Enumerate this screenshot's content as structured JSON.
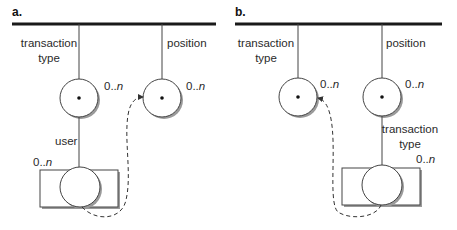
{
  "colors": {
    "line": "#1a1a1a",
    "stroke": "#444444",
    "shadow": "#9a9a9a",
    "text": "#2a2a2a"
  },
  "panels": [
    {
      "label": "a.",
      "nodes": [
        {
          "name": "transaction-type",
          "label_line1": "transaction",
          "label_line2": "type",
          "cardinality_prefix": "0..",
          "cardinality_suffix": "n"
        },
        {
          "name": "position",
          "label_line1": "position",
          "cardinality_prefix": "0..",
          "cardinality_suffix": "n"
        },
        {
          "name": "user",
          "label_line1": "user",
          "cardinality_prefix": "0..",
          "cardinality_suffix": "n"
        }
      ],
      "arrow": {
        "from": "user",
        "to": "position",
        "style": "dashed"
      }
    },
    {
      "label": "b.",
      "nodes": [
        {
          "name": "transaction-type",
          "label_line1": "transaction",
          "label_line2": "type",
          "cardinality_prefix": "0..",
          "cardinality_suffix": "n"
        },
        {
          "name": "position",
          "label_line1": "position",
          "cardinality_prefix": "0..",
          "cardinality_suffix": "n"
        },
        {
          "name": "transaction-type-nested",
          "label_line1": "transaction",
          "label_line2": "type",
          "cardinality_prefix": "0..",
          "cardinality_suffix": "n"
        }
      ],
      "arrow": {
        "from": "transaction-type-nested",
        "to": "transaction-type",
        "style": "dashed"
      }
    }
  ]
}
